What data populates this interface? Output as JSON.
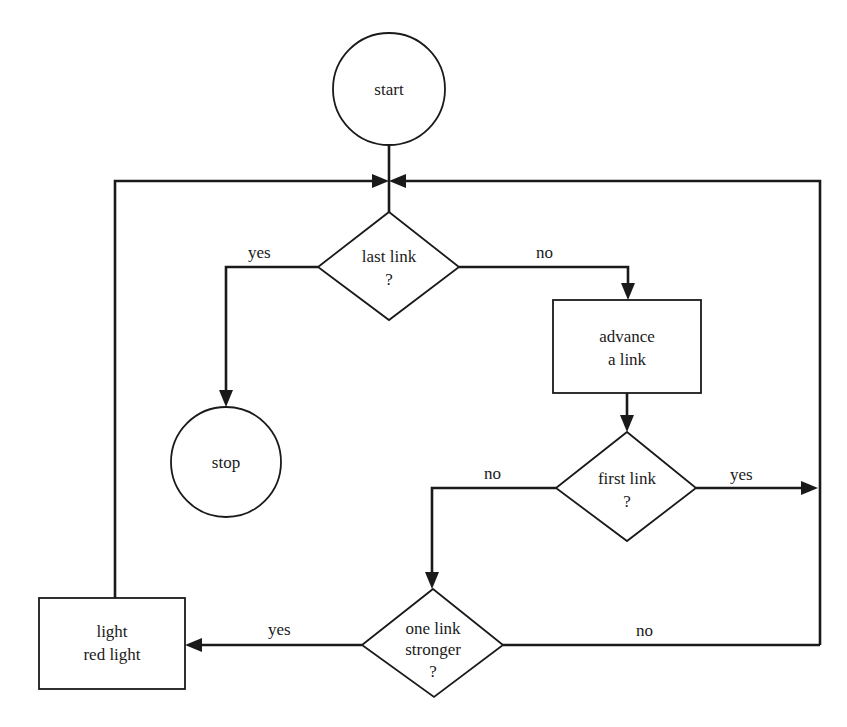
{
  "diagram": {
    "type": "flowchart",
    "colors": {
      "stroke": "#1a1a1a",
      "background": "#ffffff"
    },
    "nodes": {
      "start": {
        "shape": "circle",
        "line1": "start"
      },
      "last_link": {
        "shape": "diamond",
        "line1": "last link",
        "line2": "?"
      },
      "stop": {
        "shape": "circle",
        "line1": "stop"
      },
      "advance": {
        "shape": "rectangle",
        "line1": "advance",
        "line2": "a link"
      },
      "first_link": {
        "shape": "diamond",
        "line1": "first link",
        "line2": "?"
      },
      "stronger": {
        "shape": "diamond",
        "line1": "one link",
        "line2": "stronger",
        "line3": "?"
      },
      "red_light": {
        "shape": "rectangle",
        "line1": "light",
        "line2": "red light"
      }
    },
    "edges": {
      "last_yes": {
        "from": "last_link",
        "to": "stop",
        "label": "yes"
      },
      "last_no": {
        "from": "last_link",
        "to": "advance",
        "label": "no"
      },
      "first_no": {
        "from": "first_link",
        "to": "stronger",
        "label": "no"
      },
      "first_yes": {
        "from": "first_link",
        "to": "loop_back",
        "label": "yes"
      },
      "stronger_yes": {
        "from": "stronger",
        "to": "red_light",
        "label": "yes"
      },
      "stronger_no": {
        "from": "stronger",
        "to": "loop_back",
        "label": "no"
      }
    }
  }
}
